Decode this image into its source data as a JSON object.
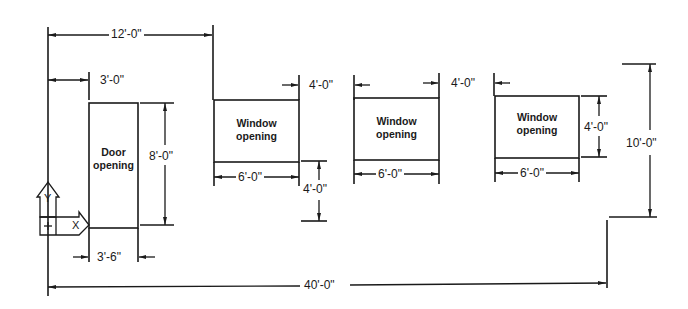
{
  "drawing": {
    "type": "wall elevation with openings",
    "line_color": "#1a1a1a",
    "background": "#ffffff",
    "openings": [
      {
        "id": "door",
        "label_line1": "Door",
        "label_line2": "opening",
        "width": "3'-6\"",
        "height": "8'-0\""
      },
      {
        "id": "window-1",
        "label_line1": "Window",
        "label_line2": "opening",
        "width": "6'-0\""
      },
      {
        "id": "window-2",
        "label_line1": "Window",
        "label_line2": "opening",
        "width": "6'-0\""
      },
      {
        "id": "window-3",
        "label_line1": "Window",
        "label_line2": "opening",
        "width": "6'-0\"",
        "height": "4'-0\""
      }
    ],
    "dimensions": {
      "origin_to_window1": "12'-0\"",
      "origin_to_door": "3'-0\"",
      "door_width": "3'-6\"",
      "door_height": "8'-0\"",
      "window1_width": "6'-0\"",
      "window1_to_window2": "4'-0\"",
      "window1_sill_height": "4'-0\"",
      "window2_width": "6'-0\"",
      "window2_to_window3": "4'-0\"",
      "window3_width": "6'-0\"",
      "window3_height": "4'-0\"",
      "wall_height": "10'-0\"",
      "wall_length": "40'-0\""
    },
    "ucs_icon": {
      "x_label": "X",
      "y_label": "Y"
    }
  }
}
